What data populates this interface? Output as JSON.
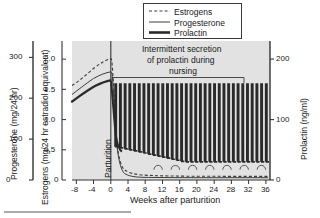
{
  "figure": {
    "plot_bg": "#e2e2e2",
    "axis_color": "#333333",
    "line_color": "#3c3c3c"
  },
  "legend": {
    "items": [
      {
        "label": "Estrogens",
        "style": "dashed-thin"
      },
      {
        "label": "Progesterone",
        "style": "solid-thin"
      },
      {
        "label": "Prolactin",
        "style": "solid-thick"
      }
    ]
  },
  "annotations": {
    "nursing": [
      "Intermittent secretion",
      "of prolactin during",
      "nursing"
    ],
    "parturition": "Parturition"
  },
  "axes": {
    "y_left_outer": {
      "title": "Progesterone (mg/24 hr)",
      "ticks": [
        "0",
        "100",
        "200",
        "300"
      ],
      "values": [
        0,
        100,
        200,
        300
      ],
      "range": [
        0,
        340
      ]
    },
    "y_left_inner": {
      "title": "Estrogens (mg/24 hr estradiol equivalent)",
      "ticks": [
        "0",
        "0.5",
        "1.0",
        "1.5",
        "2.0"
      ],
      "values": [
        0,
        0.5,
        1.0,
        1.5,
        2.0
      ],
      "range": [
        0,
        2.3
      ]
    },
    "y_right": {
      "title": "Prolactin (ng/ml)",
      "ticks": [
        "0",
        "100",
        "200"
      ],
      "values": [
        0,
        100,
        200
      ],
      "range": [
        0,
        230
      ]
    },
    "x": {
      "title": "Weeks after parturition",
      "ticks": [
        "-8",
        "-4",
        "0",
        "4",
        "8",
        "12",
        "16",
        "20",
        "24",
        "28",
        "32",
        "36"
      ],
      "values": [
        -8,
        -4,
        0,
        4,
        8,
        12,
        16,
        20,
        24,
        28,
        32,
        36
      ],
      "range": [
        -9,
        37
      ]
    }
  },
  "chart_data": {
    "type": "line",
    "title": "",
    "xlabel": "Weeks after parturition",
    "ylabel": "Estrogens (mg/24 hr estradiol equivalent)",
    "xlim": [
      -9,
      37
    ],
    "ylim": [
      0,
      2.3
    ],
    "grid": false,
    "legend_position": "top-center",
    "event_marker": {
      "x": 0,
      "label": "Parturition"
    },
    "series": [
      {
        "name": "Estrogens",
        "style": "dashed-thin",
        "axis": "y_left_inner",
        "units": "mg/24 hr estradiol equivalent",
        "x": [
          -9,
          -8,
          -7,
          -6,
          -5,
          -4,
          -3,
          -2,
          -1,
          -0.4,
          0,
          0.3,
          0.8,
          1.4,
          2,
          3,
          4,
          6,
          8,
          12,
          16,
          20,
          24,
          28,
          32,
          36
        ],
        "y": [
          1.55,
          1.62,
          1.72,
          1.82,
          1.9,
          1.97,
          2.03,
          2.07,
          2.1,
          2.1,
          2.05,
          1.3,
          0.55,
          0.28,
          0.2,
          0.16,
          0.13,
          0.1,
          0.09,
          0.08,
          0.08,
          0.08,
          0.08,
          0.08,
          0.08,
          0.08
        ]
      },
      {
        "name": "Progesterone",
        "style": "solid-thin",
        "axis": "y_left_outer",
        "units": "mg/24 hr",
        "x": [
          -9,
          -8,
          -7,
          -6,
          -5,
          -4,
          -3,
          -2,
          -1,
          -0.5,
          0,
          0.3,
          0.7,
          1.2,
          2,
          3,
          4,
          6,
          8,
          36
        ],
        "y": [
          210,
          222,
          234,
          244,
          252,
          258,
          262,
          265,
          266,
          264,
          250,
          150,
          60,
          22,
          10,
          7,
          6,
          5,
          5,
          5
        ]
      },
      {
        "name": "Prolactin",
        "style": "solid-thick",
        "axis": "y_right",
        "units": "ng/ml",
        "baseline_prepartum": [
          {
            "x": -9,
            "y": 128
          },
          {
            "x": -6,
            "y": 143
          },
          {
            "x": -3,
            "y": 156
          },
          {
            "x": -1,
            "y": 163
          },
          {
            "x": 0,
            "y": 160
          }
        ],
        "nursing_spikes": {
          "description": "Repeating suckling-induced prolactin surges, ~1 per week from week 1 to week 36",
          "peak": 160,
          "trough_start": 55,
          "trough_end": 30,
          "first_week": 1,
          "last_week": 36,
          "count": 33
        }
      },
      {
        "name": "Estrous cycles",
        "style": "arch-markers",
        "axis": "y_left_inner",
        "description": "Small arches on estrogen baseline indicating resumed estrous cycles",
        "x": [
          11,
          15,
          19,
          23,
          27,
          31,
          35
        ],
        "y": 0.17
      }
    ]
  }
}
